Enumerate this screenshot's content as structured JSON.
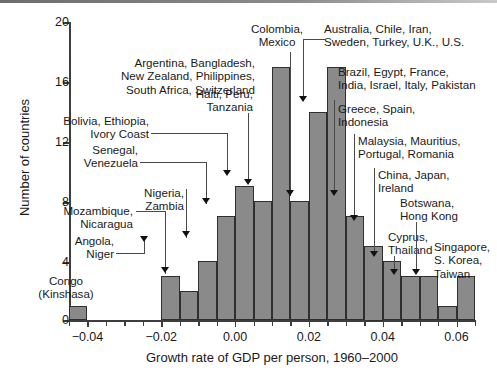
{
  "chart_data": {
    "type": "bar",
    "title": "",
    "subtitle": "",
    "xlabel": "Growth rate of GDP per person, 1960–2000",
    "ylabel": "Number of countries",
    "xlim": [
      -0.045,
      0.065
    ],
    "ylim": [
      0,
      20
    ],
    "bin_width": 0.005,
    "grid": false,
    "legend": "none",
    "x_tick_labels": [
      "−0.04",
      "−0.02",
      "0.00",
      "0.02",
      "0.04",
      "0.06"
    ],
    "x_tick_values": [
      -0.04,
      -0.02,
      0.0,
      0.02,
      0.04,
      0.06
    ],
    "x_minor_tick_values": [
      -0.045,
      -0.035,
      -0.03,
      -0.025,
      -0.015,
      -0.01,
      -0.005,
      0.005,
      0.01,
      0.015,
      0.025,
      0.03,
      0.035,
      0.045,
      0.05,
      0.055,
      0.065
    ],
    "y_tick_labels": [
      "0",
      "4",
      "8",
      "12",
      "16",
      "20"
    ],
    "y_tick_values": [
      0,
      4,
      8,
      12,
      16,
      20
    ],
    "categories": [
      "-0.045",
      "-0.040",
      "-0.035",
      "-0.030",
      "-0.025",
      "-0.020",
      "-0.015",
      "-0.010",
      "-0.005",
      "0.000",
      "0.005",
      "0.010",
      "0.015",
      "0.020",
      "0.025",
      "0.030",
      "0.035",
      "0.040",
      "0.045",
      "0.050",
      "0.055",
      "0.060"
    ],
    "bins": [
      {
        "x0": -0.045,
        "x1": -0.04,
        "value": 1
      },
      {
        "x0": -0.04,
        "x1": -0.035,
        "value": 0
      },
      {
        "x0": -0.035,
        "x1": -0.03,
        "value": 0
      },
      {
        "x0": -0.03,
        "x1": -0.025,
        "value": 0
      },
      {
        "x0": -0.025,
        "x1": -0.02,
        "value": 0
      },
      {
        "x0": -0.02,
        "x1": -0.015,
        "value": 3
      },
      {
        "x0": -0.015,
        "x1": -0.01,
        "value": 2
      },
      {
        "x0": -0.01,
        "x1": -0.005,
        "value": 4
      },
      {
        "x0": -0.005,
        "x1": 0.0,
        "value": 7
      },
      {
        "x0": 0.0,
        "x1": 0.005,
        "value": 9
      },
      {
        "x0": 0.005,
        "x1": 0.01,
        "value": 8
      },
      {
        "x0": 0.01,
        "x1": 0.015,
        "value": 17
      },
      {
        "x0": 0.015,
        "x1": 0.02,
        "value": 8
      },
      {
        "x0": 0.02,
        "x1": 0.025,
        "value": 14
      },
      {
        "x0": 0.025,
        "x1": 0.03,
        "value": 17
      },
      {
        "x0": 0.03,
        "x1": 0.035,
        "value": 7
      },
      {
        "x0": 0.035,
        "x1": 0.04,
        "value": 5
      },
      {
        "x0": 0.04,
        "x1": 0.045,
        "value": 4
      },
      {
        "x0": 0.045,
        "x1": 0.05,
        "value": 3
      },
      {
        "x0": 0.05,
        "x1": 0.055,
        "value": 3
      },
      {
        "x0": 0.055,
        "x1": 0.06,
        "value": 1
      },
      {
        "x0": 0.06,
        "x1": 0.065,
        "value": 3
      }
    ],
    "values": [
      1,
      0,
      0,
      0,
      0,
      3,
      2,
      4,
      7,
      9,
      8,
      17,
      8,
      14,
      17,
      7,
      5,
      4,
      3,
      3,
      1,
      3
    ],
    "bar_fill_color": "#8a8a8a",
    "bar_edge_color": "#2f2f2f",
    "annotations": [
      {
        "id": "congo",
        "text": "Congo\n(Kinshasa)",
        "align": "center",
        "target_bin": -0.045,
        "has_arrow": false,
        "has_leader": false
      },
      {
        "id": "angola",
        "text": "Angola,\nNiger",
        "align": "right",
        "target_bin": -0.02,
        "has_arrow": true,
        "has_leader": true
      },
      {
        "id": "mozambique",
        "text": "Mozambique,\nNicaragua",
        "align": "right",
        "target_bin": -0.015,
        "has_arrow": true,
        "has_leader": true
      },
      {
        "id": "nigeria",
        "text": "Nigeria,\nZambia",
        "align": "right",
        "target_bin": -0.01,
        "has_arrow": true,
        "has_leader": false
      },
      {
        "id": "senegal",
        "text": "Senegal,\nVenezuela",
        "align": "right",
        "target_bin": -0.005,
        "has_arrow": true,
        "has_leader": true
      },
      {
        "id": "bolivia",
        "text": "Bolivia, Ethiopia,\nIvory Coast",
        "align": "right",
        "target_bin": 0.0,
        "has_arrow": true,
        "has_leader": true
      },
      {
        "id": "haiti",
        "text": "Haiti, Peru,\nTanzania",
        "align": "right",
        "target_bin": 0.005,
        "has_arrow": true,
        "has_leader": false
      },
      {
        "id": "argentina",
        "text": "Argentina, Bangladesh,\nNew Zealand, Philippines,\nSouth Africa, Switzerland",
        "align": "right",
        "target_bin": 0.01,
        "has_arrow": false,
        "has_leader": false
      },
      {
        "id": "colombia",
        "text": "Colombia,\nMexico",
        "align": "center",
        "target_bin": 0.015,
        "has_arrow": true,
        "has_leader": false
      },
      {
        "id": "australia",
        "text": "Australia, Chile, Iran,\nSweden, Turkey, U.K., U.S.",
        "align": "left",
        "target_bin": 0.02,
        "has_arrow": true,
        "has_leader": true
      },
      {
        "id": "brazil",
        "text": "Brazil, Egypt, France,\nIndia, Israel, Italy, Pakistan",
        "align": "left",
        "target_bin": 0.025,
        "has_arrow": false,
        "has_leader": false
      },
      {
        "id": "greece",
        "text": "Greece, Spain,\nIndonesia",
        "align": "left",
        "target_bin": 0.03,
        "has_arrow": true,
        "has_leader": false
      },
      {
        "id": "malaysia",
        "text": "Malaysia, Mauritius,\nPortugal, Romania",
        "align": "left",
        "target_bin": 0.035,
        "has_arrow": true,
        "has_leader": false
      },
      {
        "id": "china",
        "text": "China, Japan,\nIreland",
        "align": "left",
        "target_bin": 0.04,
        "has_arrow": true,
        "has_leader": false
      },
      {
        "id": "cyprus",
        "text": "Cyprus,\nThailand",
        "align": "left",
        "target_bin": 0.045,
        "has_arrow": true,
        "has_leader": false
      },
      {
        "id": "botswana",
        "text": "Botswana,\nHong Kong",
        "align": "left",
        "target_bin": 0.05,
        "has_arrow": true,
        "has_leader": false
      },
      {
        "id": "singapore",
        "text": "Singapore,\nS. Korea,\nTaiwan",
        "align": "left",
        "target_bin": 0.06,
        "has_arrow": false,
        "has_leader": false
      }
    ]
  }
}
